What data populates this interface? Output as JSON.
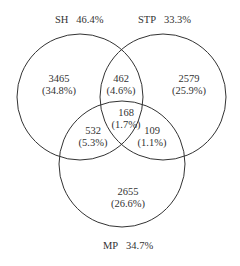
{
  "sets": [
    {
      "name": "SH",
      "percent": "46.4%"
    },
    {
      "name": "STP",
      "percent": "33.3%"
    },
    {
      "name": "MP",
      "percent": "34.7%"
    }
  ],
  "regions": {
    "sh_only": {
      "count": "3465",
      "percent": "(34.8%)"
    },
    "stp_only": {
      "count": "2579",
      "percent": "(25.9%)"
    },
    "mp_only": {
      "count": "2655",
      "percent": "(26.6%)"
    },
    "sh_stp": {
      "count": "462",
      "percent": "(4.6%)"
    },
    "sh_mp": {
      "count": "532",
      "percent": "(5.3%)"
    },
    "stp_mp": {
      "count": "109",
      "percent": "(1.1%)"
    },
    "all": {
      "count": "168",
      "percent": "(1.7%)"
    }
  },
  "colors": {
    "stroke": "#333333",
    "background": "#ffffff"
  }
}
